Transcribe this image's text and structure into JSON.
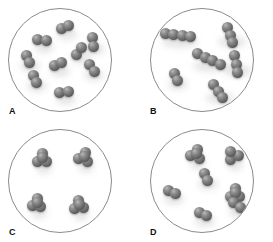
{
  "figure": {
    "background_color": "#ffffff",
    "circle_stroke_color": "#8b8b8b",
    "atom_color": "#6e6e6e",
    "atom_highlight_color": "#b9b9b9"
  },
  "panels": [
    {
      "id": "a",
      "label": "A",
      "molecule_type": "diatomic",
      "molecule_count": 9,
      "atoms_per_molecule": 2,
      "molecules": [
        {
          "x": 56,
          "y": 18,
          "angle": -28,
          "atoms": 2
        },
        {
          "x": 33,
          "y": 31,
          "angle": 5,
          "atoms": 2
        },
        {
          "x": 19,
          "y": 50,
          "angle": 72,
          "atoms": 2
        },
        {
          "x": 70,
          "y": 42,
          "angle": -55,
          "atoms": 2
        },
        {
          "x": 49,
          "y": 55,
          "angle": -20,
          "atoms": 2
        },
        {
          "x": 83,
          "y": 59,
          "angle": 48,
          "atoms": 2
        },
        {
          "x": 26,
          "y": 70,
          "angle": 63,
          "atoms": 2
        },
        {
          "x": 55,
          "y": 83,
          "angle": -8,
          "atoms": 2
        },
        {
          "x": 84,
          "y": 33,
          "angle": 80,
          "atoms": 2
        }
      ]
    },
    {
      "id": "b",
      "label": "B",
      "molecule_type": "chain",
      "molecule_count": 6,
      "atoms_per_molecule": 3,
      "molecules": [
        {
          "x": 27,
          "y": 26,
          "angle": 8,
          "atoms": 4
        },
        {
          "x": 79,
          "y": 26,
          "angle": 72,
          "atoms": 3
        },
        {
          "x": 58,
          "y": 50,
          "angle": 25,
          "atoms": 4
        },
        {
          "x": 85,
          "y": 55,
          "angle": 80,
          "atoms": 3
        },
        {
          "x": 25,
          "y": 68,
          "angle": 62,
          "atoms": 2
        },
        {
          "x": 67,
          "y": 82,
          "angle": 58,
          "atoms": 3
        }
      ]
    },
    {
      "id": "c",
      "label": "C",
      "molecule_type": "tetrahedral-cluster",
      "molecule_count": 4,
      "atoms_per_molecule": 4,
      "molecules": [
        {
          "x": 33,
          "y": 28,
          "angle": 0,
          "atoms": 4,
          "shape": "cluster"
        },
        {
          "x": 75,
          "y": 27,
          "angle": 20,
          "atoms": 4,
          "shape": "cluster"
        },
        {
          "x": 28,
          "y": 73,
          "angle": 10,
          "atoms": 4,
          "shape": "cluster"
        },
        {
          "x": 70,
          "y": 75,
          "angle": -5,
          "atoms": 4,
          "shape": "cluster"
        }
      ]
    },
    {
      "id": "d",
      "label": "D",
      "molecule_type": "mixed",
      "molecule_count": 7,
      "atoms_per_molecule": null,
      "molecules": [
        {
          "x": 45,
          "y": 24,
          "angle": 15,
          "atoms": 4,
          "shape": "cluster"
        },
        {
          "x": 82,
          "y": 25,
          "angle": -30,
          "atoms": 3,
          "shape": "cluster"
        },
        {
          "x": 55,
          "y": 47,
          "angle": 68,
          "atoms": 2
        },
        {
          "x": 21,
          "y": 62,
          "angle": 28,
          "atoms": 2
        },
        {
          "x": 84,
          "y": 63,
          "angle": 0,
          "atoms": 4,
          "shape": "cluster"
        },
        {
          "x": 52,
          "y": 84,
          "angle": 25,
          "atoms": 2
        },
        {
          "x": 86,
          "y": 75,
          "angle": 40,
          "atoms": 2
        }
      ]
    }
  ]
}
